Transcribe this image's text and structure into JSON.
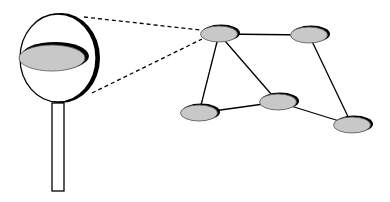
{
  "diagram": {
    "colors": {
      "background": "#ffffff",
      "node_fill": "#c8c8c8",
      "node_shadow": "#000000",
      "stroke": "#000000"
    },
    "magnifier": {
      "lens": {
        "cx": 58,
        "cy": 58,
        "rx": 38,
        "ry": 44
      },
      "inner_node": {
        "cx": 52,
        "cy": 58,
        "rx": 33,
        "ry": 13
      },
      "handle": {
        "x": 52,
        "y": 103,
        "w": 12,
        "h": 88
      }
    },
    "nodes": [
      {
        "id": "A",
        "cx": 219,
        "cy": 34
      },
      {
        "id": "B",
        "cx": 309,
        "cy": 35
      },
      {
        "id": "C",
        "cx": 199,
        "cy": 113
      },
      {
        "id": "D",
        "cx": 278,
        "cy": 102
      },
      {
        "id": "E",
        "cx": 352,
        "cy": 125
      }
    ],
    "edges": [
      [
        "A",
        "B"
      ],
      [
        "A",
        "C"
      ],
      [
        "A",
        "D"
      ],
      [
        "C",
        "D"
      ],
      [
        "D",
        "E"
      ],
      [
        "B",
        "E"
      ]
    ],
    "zoom_lines": [
      {
        "x1": 84,
        "y1": 17,
        "x2": 200,
        "y2": 30
      },
      {
        "x1": 92,
        "y1": 93,
        "x2": 202,
        "y2": 39
      }
    ]
  }
}
